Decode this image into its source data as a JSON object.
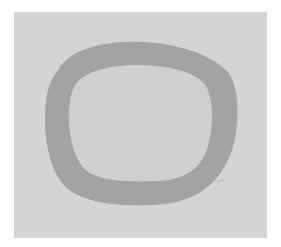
{
  "artwork": {
    "background_color": "#ffffff",
    "panel_color": "#d4d4d4",
    "ring_color": "#a3a3a3",
    "inner_color": "#cfcfcf",
    "signature_text": "~~~~"
  }
}
